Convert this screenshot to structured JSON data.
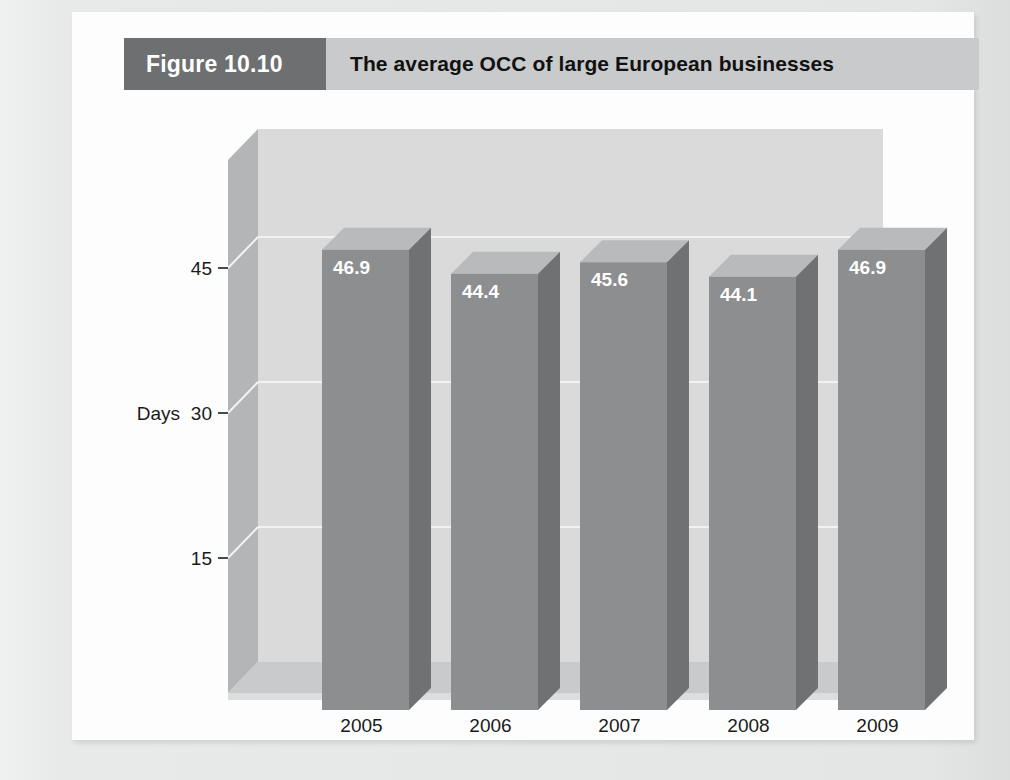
{
  "figure": {
    "number_label": "Figure 10.10",
    "title": "The average OCC of large European businesses"
  },
  "colors": {
    "header_band": "#c9cacb",
    "header_number_block": "#6e6f70",
    "bar_front": "#8d8e90",
    "bar_side": "#6f7173",
    "bar_top": "#b9babb",
    "back_wall": "#d9dad9",
    "side_wall": "#b4b5b6",
    "floor": "#c9cacb",
    "gridline": "#f2f2f2",
    "page_background": "#e9eaea",
    "card_background": "#fdfdfd",
    "text_dark": "#1a1a1a",
    "text_light": "#ffffff"
  },
  "chart_data": {
    "type": "bar",
    "title": "The average OCC of large European businesses",
    "categories": [
      "2005",
      "2006",
      "2007",
      "2008",
      "2009"
    ],
    "values": [
      46.9,
      44.4,
      45.6,
      44.1,
      46.9
    ],
    "value_labels": [
      "46.9",
      "44.4",
      "45.6",
      "44.1",
      "46.9"
    ],
    "xlabel": "",
    "ylabel": "Days",
    "ytick_labels": [
      "15",
      "30",
      "45"
    ],
    "yticks": [
      15,
      30,
      45
    ],
    "ylim": [
      0,
      52
    ],
    "grid": true,
    "legend": "none",
    "style": "3d-column"
  }
}
